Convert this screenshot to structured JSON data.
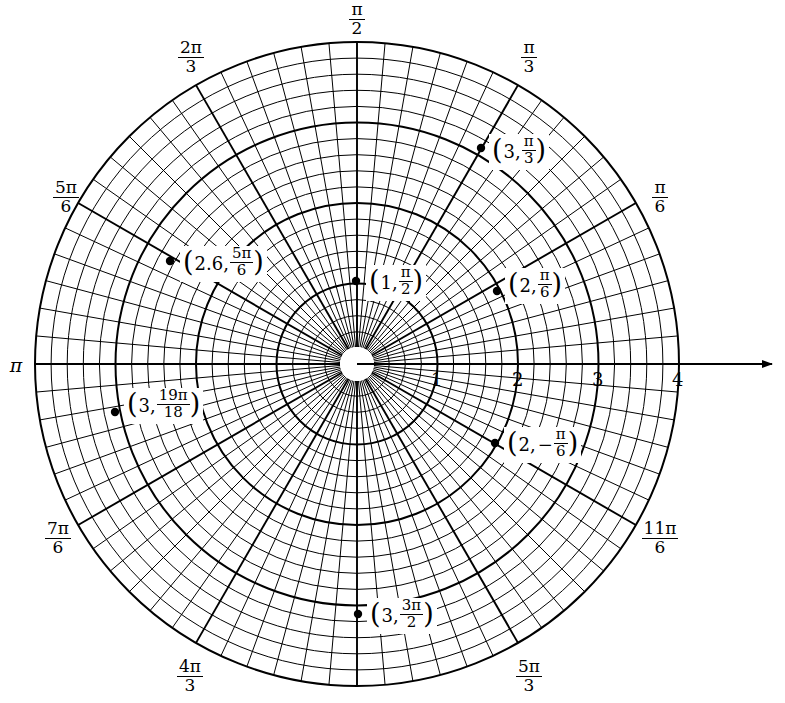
{
  "figure": {
    "type": "polar-grid",
    "title": "",
    "center": {
      "x": 357,
      "y": 364
    },
    "max_radius": 4,
    "pixels_per_unit": 80.5,
    "hole_radius_px": 17,
    "background": "#ffffff",
    "line_color": "#000000"
  },
  "axis": {
    "name": "polar-axis",
    "direction": "right-arrow",
    "tick_values": [
      "1",
      "2",
      "3",
      "4"
    ],
    "tick_positions_px": [
      437,
      518,
      598,
      678
    ],
    "arrow_end_x": 780
  },
  "angle_labels": [
    {
      "id": "a-pi-2",
      "num": "π",
      "den": "2",
      "x": 357,
      "y": 2,
      "whole": null
    },
    {
      "id": "a-2pi-3",
      "num": "2π",
      "den": "3",
      "x": 191,
      "y": 40,
      "whole": null
    },
    {
      "id": "a-5pi-6",
      "num": "5π",
      "den": "6",
      "x": 66,
      "y": 180,
      "whole": null
    },
    {
      "id": "a-pi",
      "num": null,
      "den": null,
      "x": 16,
      "y": 356,
      "whole": "π"
    },
    {
      "id": "a-7pi-6",
      "num": "7π",
      "den": "6",
      "x": 58,
      "y": 521,
      "whole": null
    },
    {
      "id": "a-4pi-3",
      "num": "4π",
      "den": "3",
      "x": 190,
      "y": 659,
      "whole": null
    },
    {
      "id": "a-3pi-2",
      "num": null,
      "den": null,
      "x": 357,
      "y": 688,
      "whole": null
    },
    {
      "id": "a-5pi-3",
      "num": "5π",
      "den": "3",
      "x": 529,
      "y": 659,
      "whole": null
    },
    {
      "id": "a-11pi-6",
      "num": "11π",
      "den": "6",
      "x": 660,
      "y": 521,
      "whole": null
    },
    {
      "id": "a-pi-6",
      "num": "π",
      "den": "6",
      "x": 660,
      "y": 180,
      "whole": null
    },
    {
      "id": "a-pi-3",
      "num": "π",
      "den": "3",
      "x": 529,
      "y": 40,
      "whole": null
    }
  ],
  "points": [
    {
      "id": "p-3-pi-3",
      "name": "point-3-pi-over-3",
      "r": 3,
      "theta_label": "π/3",
      "dot_px": {
        "x": 481,
        "y": 148
      },
      "label": {
        "r_text": "3",
        "frac_num": "π",
        "frac_den": "3",
        "sign": "",
        "x": 489,
        "y": 134
      }
    },
    {
      "id": "p-2p6-5pi-6",
      "name": "point-2point6-5pi-over-6",
      "r": 2.6,
      "theta_label": "5π/6",
      "dot_px": {
        "x": 170,
        "y": 261
      },
      "label": {
        "r_text": "2.6",
        "frac_num": "5π",
        "frac_den": "6",
        "sign": "",
        "x": 180,
        "y": 246
      }
    },
    {
      "id": "p-1-pi-2",
      "name": "point-1-pi-over-2",
      "r": 1,
      "theta_label": "π/2",
      "dot_px": {
        "x": 356,
        "y": 281
      },
      "label": {
        "r_text": "1",
        "frac_num": "π",
        "frac_den": "2",
        "sign": "",
        "x": 366,
        "y": 265
      }
    },
    {
      "id": "p-2-pi-6",
      "name": "point-2-pi-over-6",
      "r": 2,
      "theta_label": "π/6",
      "dot_px": {
        "x": 497,
        "y": 291
      },
      "label": {
        "r_text": "2",
        "frac_num": "π",
        "frac_den": "6",
        "sign": "",
        "x": 505,
        "y": 268
      }
    },
    {
      "id": "p-3-19pi-18",
      "name": "point-3-19pi-over-18",
      "r": 3,
      "theta_label": "19π/18",
      "dot_px": {
        "x": 115,
        "y": 412
      },
      "label": {
        "r_text": "3",
        "frac_num": "19π",
        "frac_den": "18",
        "sign": "",
        "x": 124,
        "y": 388
      }
    },
    {
      "id": "p-2-neg-pi-6",
      "name": "point-2-negative-pi-over-6",
      "r": 2,
      "theta_label": "−π/6",
      "dot_px": {
        "x": 495,
        "y": 443
      },
      "label": {
        "r_text": "2",
        "frac_num": "π",
        "frac_den": "6",
        "sign": "−",
        "x": 504,
        "y": 427
      }
    },
    {
      "id": "p-3-3pi-2",
      "name": "point-3-3pi-over-2",
      "r": 3,
      "theta_label": "3π/2",
      "dot_px": {
        "x": 358,
        "y": 614
      },
      "label": {
        "r_text": "3",
        "frac_num": "3π",
        "frac_den": "2",
        "sign": "",
        "x": 367,
        "y": 598
      }
    }
  ],
  "chart_data": {
    "type": "scatter",
    "coordinate_system": "polar",
    "title": "",
    "xlabel": "",
    "ylabel": "",
    "rlim": [
      0,
      4
    ],
    "r_ticks": [
      1,
      2,
      3,
      4
    ],
    "theta_ticks_labels": [
      "π/2",
      "2π/3",
      "5π/6",
      "π",
      "7π/6",
      "4π/3",
      "3π/2",
      "5π/3",
      "11π/6",
      "π/6",
      "π/3"
    ],
    "grid": true,
    "legend": "none",
    "points": [
      {
        "label": "(3, π/3)",
        "r": 3,
        "theta_rad": 1.0472
      },
      {
        "label": "(2.6, 5π/6)",
        "r": 2.6,
        "theta_rad": 2.618
      },
      {
        "label": "(1, π/2)",
        "r": 1,
        "theta_rad": 1.5708
      },
      {
        "label": "(2, π/6)",
        "r": 2,
        "theta_rad": 0.5236
      },
      {
        "label": "(3, 19π/18)",
        "r": 3,
        "theta_rad": 3.3161
      },
      {
        "label": "(2, −π/6)",
        "r": 2,
        "theta_rad": -0.5236
      },
      {
        "label": "(3, 3π/2)",
        "r": 3,
        "theta_rad": 4.7124
      }
    ]
  }
}
